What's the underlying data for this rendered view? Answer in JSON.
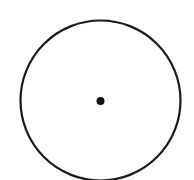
{
  "diagram": {
    "type": "circle-with-center-point",
    "background": "#ffffff",
    "circle": {
      "cx": 100.5,
      "cy": 100.5,
      "r": 80,
      "stroke": "#1a1a1a",
      "stroke_width": 2.2
    },
    "center_point": {
      "cx": 100.5,
      "cy": 101,
      "r": 4,
      "fill": "#111111"
    }
  }
}
